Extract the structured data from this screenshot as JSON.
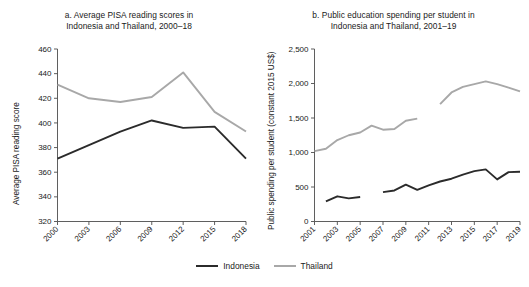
{
  "figure": {
    "background": "#ffffff",
    "width": 529,
    "height": 287
  },
  "legend": {
    "position": "bottom-center",
    "items": [
      {
        "label": "Indonesia",
        "color": "#2b2b2b",
        "swatch_name": "legend-swatch-indonesia"
      },
      {
        "label": "Thailand",
        "color": "#a8a8a8",
        "swatch_name": "legend-swatch-thailand"
      }
    ]
  },
  "panel_a": {
    "title_line1": "a. Average PISA reading scores in",
    "title_line2": "Indonesia and Thailand, 2000–18",
    "ylabel": "Average PISA reading score",
    "xlabel": "",
    "yticks": [
      "320",
      "340",
      "360",
      "380",
      "400",
      "420",
      "440",
      "460"
    ],
    "xticks": [
      "2000",
      "2003",
      "2006",
      "2009",
      "2012",
      "2015",
      "2018"
    ]
  },
  "panel_b": {
    "title_line1": "b. Public education spending per student in",
    "title_line2": "Indonesia and Thailand, 2001–19",
    "ylabel": "Public spending per student (constant 2015 US$)",
    "xlabel": "",
    "yticks": [
      "0",
      "500",
      "1,000",
      "1,500",
      "2,000",
      "2,500"
    ],
    "xticks": [
      "2001",
      "2003",
      "2005",
      "2007",
      "2009",
      "2011",
      "2013",
      "2015",
      "2017",
      "2019"
    ]
  },
  "chart_data": [
    {
      "type": "line",
      "panel": "a",
      "title": "a. Average PISA reading scores in Indonesia and Thailand, 2000–18",
      "xlabel": "",
      "ylabel": "Average PISA reading score",
      "ylim": [
        320,
        460
      ],
      "xlim": [
        2000,
        2018
      ],
      "ytick_step": 20,
      "xtick_step": 3,
      "grid": false,
      "legend_position": "bottom-center",
      "x": [
        2000,
        2003,
        2006,
        2009,
        2012,
        2015,
        2018
      ],
      "series": [
        {
          "name": "Indonesia",
          "color": "#2b2b2b",
          "values": [
            371,
            382,
            393,
            402,
            396,
            397,
            371
          ]
        },
        {
          "name": "Thailand",
          "color": "#a8a8a8",
          "values": [
            431,
            420,
            417,
            421,
            441,
            409,
            393
          ]
        }
      ]
    },
    {
      "type": "line",
      "panel": "b",
      "title": "b. Public education spending per student in Indonesia and Thailand, 2001–19",
      "xlabel": "",
      "ylabel": "Public spending per student (constant 2015 US$)",
      "ylim": [
        0,
        2500
      ],
      "xlim": [
        2001,
        2019
      ],
      "ytick_step": 500,
      "xtick_step": 2,
      "grid": false,
      "legend_position": "bottom-center",
      "x": [
        2001,
        2002,
        2003,
        2004,
        2005,
        2006,
        2007,
        2008,
        2009,
        2010,
        2011,
        2012,
        2013,
        2014,
        2015,
        2016,
        2017,
        2018,
        2019
      ],
      "series": [
        {
          "name": "Indonesia",
          "color": "#2b2b2b",
          "segments": [
            {
              "x": [
                2002,
                2003,
                2004,
                2005
              ],
              "values": [
                290,
                365,
                335,
                355
              ]
            },
            {
              "x": [
                2007,
                2008,
                2009,
                2010,
                2011,
                2012,
                2013,
                2014,
                2015,
                2016,
                2017,
                2018,
                2019
              ],
              "values": [
                425,
                450,
                535,
                460,
                525,
                580,
                620,
                680,
                730,
                755,
                610,
                715,
                720
              ]
            }
          ]
        },
        {
          "name": "Thailand",
          "color": "#a8a8a8",
          "segments": [
            {
              "x": [
                2001,
                2002,
                2003,
                2004,
                2005,
                2006,
                2007,
                2008,
                2009,
                2010
              ],
              "values": [
                1020,
                1055,
                1180,
                1250,
                1290,
                1390,
                1330,
                1340,
                1460,
                1490
              ]
            },
            {
              "x": [
                2012,
                2013,
                2014,
                2015,
                2016,
                2017,
                2018,
                2019
              ],
              "values": [
                1700,
                1870,
                1950,
                1990,
                2030,
                1990,
                1940,
                1885
              ]
            }
          ]
        }
      ]
    }
  ]
}
